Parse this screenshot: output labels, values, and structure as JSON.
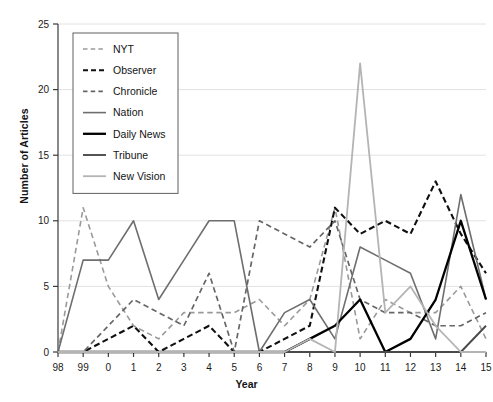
{
  "chart_data": {
    "type": "line",
    "title": "",
    "xlabel": "Year",
    "ylabel": "Number of Articles",
    "categories": [
      "98",
      "99",
      "0",
      "1",
      "2",
      "3",
      "4",
      "5",
      "6",
      "7",
      "8",
      "9",
      "10",
      "11",
      "12",
      "13",
      "14",
      "15"
    ],
    "ylim": [
      0,
      25
    ],
    "yticks": [
      0,
      5,
      10,
      15,
      20,
      25
    ],
    "grid": true,
    "legend_position": "upper-left",
    "series": [
      {
        "name": "NYT",
        "color": "#9a9a9a",
        "style": "dashed",
        "width": 1.6,
        "values": [
          0,
          11,
          5,
          2,
          1,
          3,
          3,
          3,
          4,
          2,
          4,
          11,
          1,
          4,
          3,
          3,
          5,
          1
        ]
      },
      {
        "name": "Observer",
        "color": "#101010",
        "style": "dashed",
        "width": 2.1,
        "values": [
          0,
          0,
          1,
          2,
          0,
          1,
          2,
          0,
          0,
          1,
          2,
          11,
          9,
          10,
          9,
          13,
          9,
          6
        ]
      },
      {
        "name": "Chronicle",
        "color": "#666666",
        "style": "dashed",
        "width": 1.7,
        "values": [
          0,
          0,
          2,
          4,
          3,
          2,
          6,
          0,
          10,
          9,
          8,
          10,
          4,
          3,
          3,
          2,
          2,
          3
        ]
      },
      {
        "name": "Nation",
        "color": "#6e6e6e",
        "style": "solid",
        "width": 1.6,
        "values": [
          0,
          7,
          7,
          10,
          4,
          7,
          10,
          10,
          0,
          3,
          4,
          1,
          8,
          7,
          6,
          1,
          12,
          4
        ]
      },
      {
        "name": "Daily News",
        "color": "#000000",
        "style": "solid",
        "width": 2.3,
        "values": [
          0,
          0,
          0,
          0,
          0,
          0,
          0,
          0,
          0,
          0,
          1,
          2,
          4,
          0,
          1,
          4,
          10,
          4
        ]
      },
      {
        "name": "Tribune",
        "color": "#4a4a4a",
        "style": "solid",
        "width": 1.9,
        "values": [
          0,
          0,
          0,
          0,
          0,
          0,
          0,
          0,
          0,
          0,
          0,
          0,
          0,
          0,
          0,
          0,
          0,
          2
        ]
      },
      {
        "name": "New Vision",
        "color": "#b4b4b4",
        "style": "solid",
        "width": 1.8,
        "values": [
          0,
          0,
          0,
          0,
          0,
          0,
          0,
          0,
          0,
          0,
          1,
          0,
          22,
          3,
          5,
          2,
          0,
          0
        ]
      }
    ]
  },
  "axis": {
    "y_title": "Number of Articles",
    "x_title": "Year"
  }
}
